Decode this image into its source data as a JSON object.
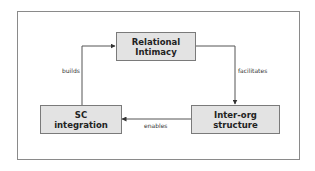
{
  "diagram": {
    "nodes": [
      {
        "id": "relational",
        "lines": [
          "Relational",
          "Intimacy"
        ]
      },
      {
        "id": "sc",
        "lines": [
          "SC",
          "integration"
        ]
      },
      {
        "id": "interorg",
        "lines": [
          "Inter-org",
          "structure"
        ]
      }
    ],
    "edges": [
      {
        "from": "sc",
        "to": "relational",
        "label": "builds"
      },
      {
        "from": "relational",
        "to": "interorg",
        "label": "facilitates"
      },
      {
        "from": "interorg",
        "to": "sc",
        "label": "enables"
      }
    ],
    "colors": {
      "node_fill": "#e3e3e3",
      "node_border": "#7a7a7a",
      "line": "#555555",
      "frame": "#8a8a8a"
    }
  }
}
